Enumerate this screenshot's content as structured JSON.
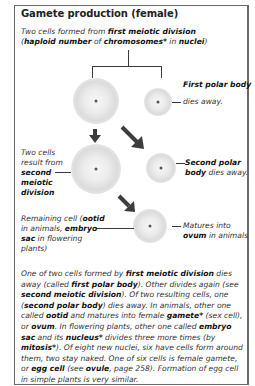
{
  "title": "Gamete production (female)",
  "intro": {
    "l1_a": "Two cells formed from ",
    "l1_b": "first meiotic division",
    "l2_a": "(",
    "l2_b": "haploid number",
    "l2_c": " of ",
    "l2_d": "chromosomes*",
    "l2_e": " in ",
    "l2_f": "nuclei",
    "l2_g": ")"
  },
  "first_polar": {
    "bold": "First polar body",
    "rest": "dies away."
  },
  "second_division": {
    "l1": "Two cells",
    "l2": "result from",
    "l3": "second",
    "l4": "meiotic",
    "l5": "division"
  },
  "second_polar": {
    "l1_bold": "Second polar",
    "l2_bold": "body",
    "l2_rest": " dies away."
  },
  "remaining": {
    "l1_a": "Remaining cell (",
    "l1_b": "ootid",
    "l2_a": "in animals, ",
    "l2_b": "embryo",
    "l3_a": "sac",
    "l3_b": " in flowering",
    "l4": "plants)"
  },
  "matures": {
    "l1": "Matures into",
    "l2_bold": "ovum",
    "l2_rest": " in animals"
  },
  "paragraph": [
    {
      "t": "One of two cells formed by "
    },
    {
      "b": "first meiotic division"
    },
    {
      "t": " dies away (called "
    },
    {
      "b": "first polar body"
    },
    {
      "t": "). Other divides again (see "
    },
    {
      "b": "second meiotic division"
    },
    {
      "t": "). Of two resulting cells, one ("
    },
    {
      "b": "second polar body"
    },
    {
      "t": ") dies away. In animals, other one called "
    },
    {
      "b": "ootid"
    },
    {
      "t": " and matures into female "
    },
    {
      "b": "gamete*"
    },
    {
      "t": " (sex cell), or "
    },
    {
      "b": "ovum"
    },
    {
      "t": ". In flowering plants, other one called "
    },
    {
      "b": "embryo sac"
    },
    {
      "t": " and its "
    },
    {
      "b": "nucleus*"
    },
    {
      "t": " divides three more times (by "
    },
    {
      "b": "mitosis*"
    },
    {
      "t": "). Of eight new nuclei, six have cells form around them, two stay naked. One of six cells is female gamete, or "
    },
    {
      "b": "egg cell"
    },
    {
      "t": " (see "
    },
    {
      "b": "ovule"
    },
    {
      "t": ", page 258). Formation of egg cell in simple plants is very similar."
    }
  ],
  "colors": {
    "border": "#6a6a6a",
    "arrow": "#3d3d3d",
    "text": "#333333"
  }
}
